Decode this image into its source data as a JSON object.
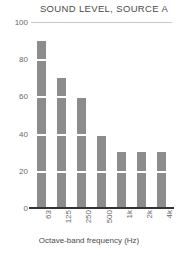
{
  "chart_data": {
    "type": "bar",
    "title": "SOUND LEVEL, SOURCE A",
    "xlabel": "Octave-band frequency (Hz)",
    "ylabel": "",
    "categories": [
      "63",
      "125",
      "250",
      "500",
      "1k",
      "2k",
      "4k"
    ],
    "values": [
      90,
      70,
      60,
      40,
      30,
      30,
      30
    ],
    "ylim": [
      0,
      100
    ],
    "yticks": [
      0,
      20,
      40,
      60,
      80,
      100
    ],
    "ytick_labels": [
      "0",
      "20",
      "40",
      "60",
      "80",
      "100"
    ],
    "grid": true,
    "legend": "none",
    "bar_color": "#8c8c8c",
    "grid_color": "#c9c9c9",
    "axis_color": "#333333"
  }
}
